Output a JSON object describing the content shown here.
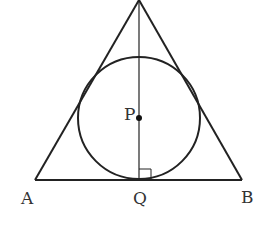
{
  "diagram": {
    "type": "geometry",
    "stroke_color": "#222222",
    "labels": {
      "A": "A",
      "B": "B",
      "Q": "Q",
      "P": "P"
    },
    "points": {
      "apex": [
        139,
        0
      ],
      "A": [
        35,
        180
      ],
      "B": [
        242,
        180
      ],
      "Q": [
        139,
        180
      ],
      "P": [
        139,
        118
      ]
    },
    "circle": {
      "center": "P",
      "radius": 61
    },
    "right_angle_at": "Q"
  }
}
